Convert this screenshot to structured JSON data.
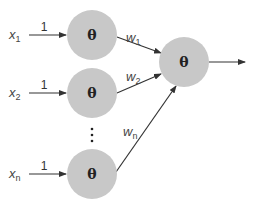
{
  "diagram": {
    "title": "",
    "node_color": "#c8c8c8",
    "edge_color": "#333333",
    "hidden_nodes": [
      {
        "id": "h1",
        "symbol": "θ",
        "cx": 92,
        "cy": 35
      },
      {
        "id": "h2",
        "symbol": "θ",
        "cx": 92,
        "cy": 93
      },
      {
        "id": "hn",
        "symbol": "θ",
        "cx": 92,
        "cy": 174
      }
    ],
    "output_node": {
      "id": "out",
      "symbol": "θ",
      "cx": 184,
      "cy": 62
    },
    "inputs": [
      {
        "var": "x",
        "sub": "1",
        "weight_label": "1"
      },
      {
        "var": "x",
        "sub": "2",
        "weight_label": "1"
      },
      {
        "var": "x",
        "sub": "n",
        "weight_label": "1"
      }
    ],
    "weights": [
      {
        "var": "w",
        "sub": "1"
      },
      {
        "var": "w",
        "sub": "2"
      },
      {
        "var": "w",
        "sub": "n"
      }
    ],
    "ellipsis": "⋮"
  }
}
